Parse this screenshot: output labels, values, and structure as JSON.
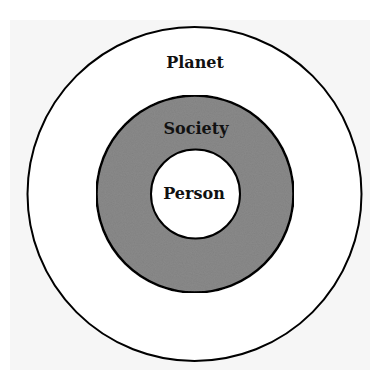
{
  "diagram": {
    "type": "concentric-circles",
    "layers": [
      {
        "label": "Planet",
        "fill": "#ffffff",
        "stroke": "#000000",
        "order": "outer"
      },
      {
        "label": "Society",
        "fill": "#8a8a8a",
        "stroke": "#000000",
        "order": "middle"
      },
      {
        "label": "Person",
        "fill": "#ffffff",
        "stroke": "#000000",
        "order": "inner"
      }
    ]
  },
  "colors": {
    "background": "#f6f6f6",
    "society_fill": "#8a8a8a",
    "line": "#000000"
  }
}
